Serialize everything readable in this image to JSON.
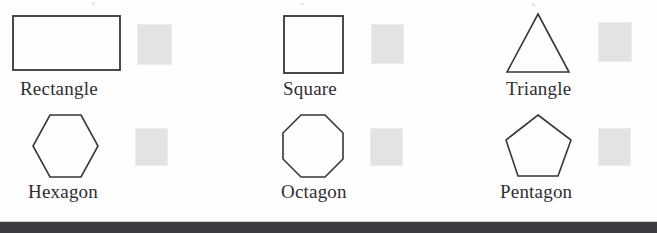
{
  "page": {
    "width": 657,
    "height": 233,
    "background_color": "#fefefe"
  },
  "colors": {
    "shape_outline": "#36363b",
    "label_text": "#2e2e33",
    "swatch_fill": "#e3e3e3",
    "swatch_border": "#ececec",
    "bottom_bar": "#3b3b40",
    "bottom_bar_highlight": "#cfcfcf"
  },
  "shapes": [
    {
      "id": "rectangle",
      "label": "Rectangle",
      "shape_type": "rectangle",
      "sides": 4,
      "outline_color": "#36363b",
      "fill": "none",
      "box": {
        "x": 12,
        "y": 15,
        "width": 108,
        "height": 55
      },
      "label_pos": {
        "x": 20,
        "y": 78
      },
      "swatch": {
        "x": 137,
        "y": 24,
        "width": 35,
        "height": 41
      }
    },
    {
      "id": "square",
      "label": "Square",
      "shape_type": "square",
      "sides": 4,
      "outline_color": "#36363b",
      "fill": "none",
      "box": {
        "x": 283,
        "y": 15,
        "width": 60,
        "height": 58
      },
      "label_pos": {
        "x": 283,
        "y": 78
      },
      "swatch": {
        "x": 371,
        "y": 24,
        "width": 33,
        "height": 40
      }
    },
    {
      "id": "triangle",
      "label": "Triangle",
      "shape_type": "triangle",
      "sides": 3,
      "outline_color": "#36363b",
      "fill": "none",
      "box": {
        "x": 507,
        "y": 13,
        "width": 62,
        "height": 59
      },
      "label_pos": {
        "x": 506,
        "y": 78
      },
      "swatch": {
        "x": 598,
        "y": 22,
        "width": 34,
        "height": 40
      }
    },
    {
      "id": "hexagon",
      "label": "Hexagon",
      "shape_type": "hexagon",
      "sides": 6,
      "outline_color": "#36363b",
      "fill": "none",
      "box": {
        "x": 32,
        "y": 114,
        "width": 66,
        "height": 63
      },
      "label_pos": {
        "x": 28,
        "y": 181
      },
      "swatch": {
        "x": 135,
        "y": 128,
        "width": 33,
        "height": 38
      }
    },
    {
      "id": "octagon",
      "label": "Octagon",
      "shape_type": "octagon",
      "sides": 8,
      "outline_color": "#36363b",
      "fill": "none",
      "box": {
        "x": 282,
        "y": 114,
        "width": 62,
        "height": 63
      },
      "label_pos": {
        "x": 281,
        "y": 181
      },
      "swatch": {
        "x": 370,
        "y": 128,
        "width": 33,
        "height": 38
      }
    },
    {
      "id": "pentagon",
      "label": "Pentagon",
      "shape_type": "pentagon",
      "sides": 5,
      "outline_color": "#36363b",
      "fill": "none",
      "box": {
        "x": 505,
        "y": 114,
        "width": 66,
        "height": 62
      },
      "label_pos": {
        "x": 500,
        "y": 181
      },
      "swatch": {
        "x": 598,
        "y": 128,
        "width": 33,
        "height": 38
      }
    }
  ],
  "bottom_bar": {
    "y": 222,
    "height": 11,
    "highlight_y": 221
  }
}
